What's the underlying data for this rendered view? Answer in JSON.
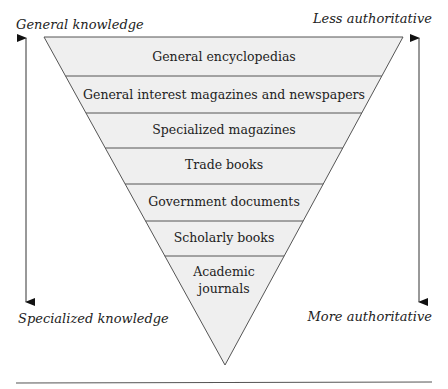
{
  "diagram": {
    "type": "inverted-pyramid",
    "fill_color": "#efefef",
    "line_color": "#555555",
    "labels": {
      "top_left": "General knowledge",
      "top_right": "Less authoritative",
      "bottom_left": "Specialized knowledge",
      "bottom_right": "More authoritative"
    },
    "levels": [
      {
        "label": "General encyclopedias"
      },
      {
        "label": "General interest magazines and newspapers"
      },
      {
        "label": "Specialized magazines"
      },
      {
        "label": "Trade books"
      },
      {
        "label": "Government documents"
      },
      {
        "label": "Scholarly books"
      },
      {
        "label_line1": "Academic",
        "label_line2": "journals"
      }
    ]
  }
}
